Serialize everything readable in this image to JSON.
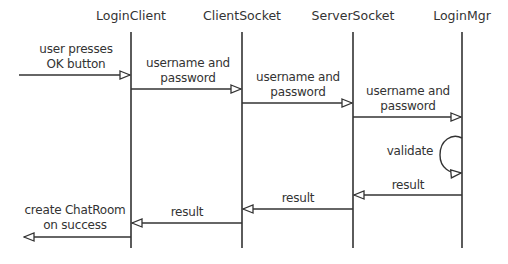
{
  "diagram": {
    "type": "sequence",
    "objects": [
      {
        "name": "LoginClient",
        "x": 131
      },
      {
        "name": "ClientSocket",
        "x": 242
      },
      {
        "name": "ServerSocket",
        "x": 353
      },
      {
        "name": "LoginMgr",
        "x": 462
      }
    ],
    "messages": [
      {
        "from": "external",
        "to": "LoginClient",
        "line1": "user presses",
        "line2": "OK button"
      },
      {
        "from": "LoginClient",
        "to": "ClientSocket",
        "line1": "username and",
        "line2": "password"
      },
      {
        "from": "ClientSocket",
        "to": "ServerSocket",
        "line1": "username and",
        "line2": "password"
      },
      {
        "from": "ServerSocket",
        "to": "LoginMgr",
        "line1": "username and",
        "line2": "password"
      },
      {
        "from": "LoginMgr",
        "to": "LoginMgr",
        "line1": "validate"
      },
      {
        "from": "LoginMgr",
        "to": "ServerSocket",
        "line1": "result"
      },
      {
        "from": "ServerSocket",
        "to": "ClientSocket",
        "line1": "result"
      },
      {
        "from": "ClientSocket",
        "to": "LoginClient",
        "line1": "result"
      },
      {
        "from": "LoginClient",
        "to": "external",
        "line1": "create ChatRoom",
        "line2": "on success"
      }
    ],
    "line_color": "#333333"
  }
}
